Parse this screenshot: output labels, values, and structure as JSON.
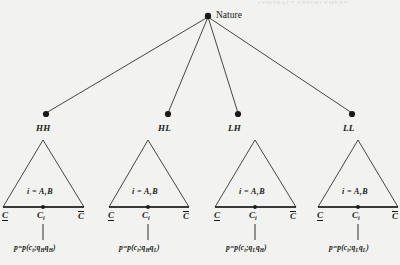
{
  "figure": {
    "title_bleed": "CONTRACT ENFORCEMENT",
    "root": {
      "label": "Nature",
      "x": 208,
      "y": 18
    },
    "branches": [
      {
        "id": "HH",
        "label": "HH",
        "node_x": 46,
        "node_y": 114,
        "tri_apex_x": 43,
        "tri_left_x": 3,
        "tri_right_x": 84,
        "info": "i = A,B",
        "lower_c": "C",
        "mid_c": "C",
        "mid_sub": "i",
        "upper_c": "C",
        "formula_prefix": "p=p(c",
        "formula_sub1": "i",
        "formula_mid": ";q",
        "formula_sub2": "H",
        "formula_mid2": "q",
        "formula_sub3": "H",
        "formula_suffix": ")"
      },
      {
        "id": "HL",
        "label": "HL",
        "node_x": 168,
        "node_y": 114,
        "tri_apex_x": 148,
        "tri_left_x": 109,
        "tri_right_x": 189,
        "info": "i = A,B",
        "lower_c": "C",
        "mid_c": "C",
        "mid_sub": "i",
        "upper_c": "C",
        "formula_prefix": "p=p(c",
        "formula_sub1": "i",
        "formula_mid": ";q",
        "formula_sub2": "H",
        "formula_mid2": "q",
        "formula_sub3": "L",
        "formula_suffix": ")"
      },
      {
        "id": "LH",
        "label": "LH",
        "node_x": 238,
        "node_y": 114,
        "tri_apex_x": 255,
        "tri_left_x": 215,
        "tri_right_x": 296,
        "info": "i = A,B",
        "lower_c": "C",
        "mid_c": "C",
        "mid_sub": "i",
        "upper_c": "C",
        "formula_prefix": "p=p(c",
        "formula_sub1": "i",
        "formula_mid": ";q",
        "formula_sub2": "L",
        "formula_mid2": "q",
        "formula_sub3": "H",
        "formula_suffix": ")"
      },
      {
        "id": "LL",
        "label": "LL",
        "node_x": 352,
        "node_y": 114,
        "tri_apex_x": 358,
        "tri_left_x": 318,
        "tri_right_x": 398,
        "info": "i = A,B",
        "lower_c": "C",
        "mid_c": "C",
        "mid_sub": "i",
        "upper_c": "C",
        "formula_prefix": "p=p(c",
        "formula_sub1": "i",
        "formula_mid": ";q",
        "formula_sub2": "L",
        "formula_mid2": "q",
        "formula_sub3": "L",
        "formula_suffix": ")"
      }
    ],
    "geometry": {
      "tri_top_y": 140,
      "tri_base_y": 207,
      "info_y": 192,
      "c_row_y": 211,
      "stem_top_y": 208,
      "stem_bottom_y": 238,
      "formula_y": 245
    },
    "colors": {
      "ink": "#1a1a1a",
      "background": "#f2f2f0"
    }
  }
}
